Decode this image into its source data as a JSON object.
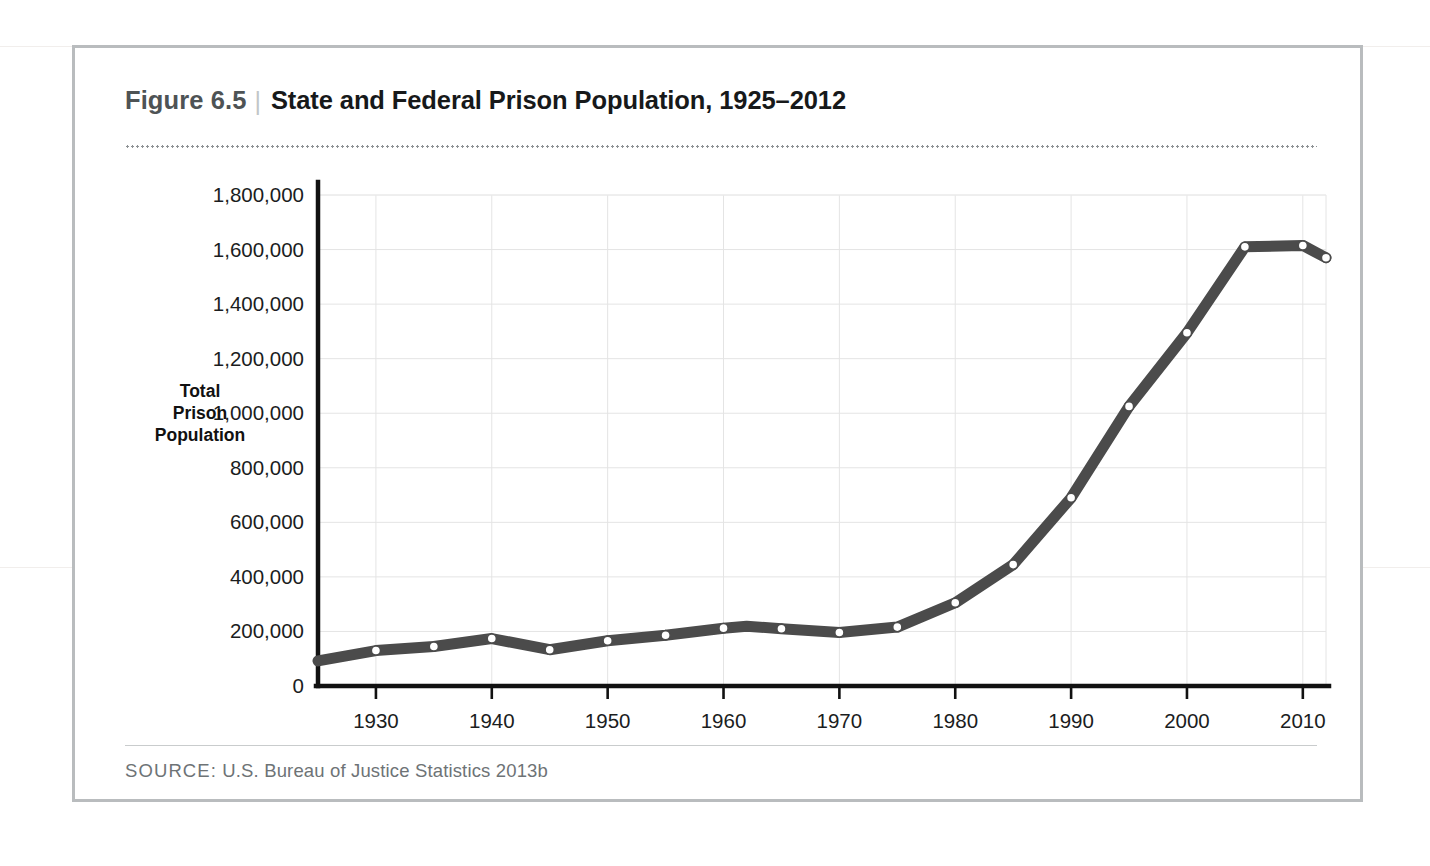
{
  "figure": {
    "number": "Figure 6.5",
    "divider": "|",
    "title": "State and Federal Prison Population, 1925–2012",
    "source_label": "SOURCE:",
    "source_text": " U.S. Bureau of Justice Statistics 2013b"
  },
  "colors": {
    "line": "#4b4b4b",
    "marker_fill": "#ffffff",
    "gridline": "#e4e4e4",
    "axis": "#111111",
    "frame": "#b9bcbe",
    "title": "#17191a",
    "figure_number": "#4e5355",
    "source": "#6e7376"
  },
  "chart_data": {
    "type": "line",
    "title": "State and Federal Prison Population, 1925–2012",
    "xlabel": "",
    "ylabel": "Total Prison Population",
    "ylabel_lines": [
      "Total",
      "Prison",
      "Population"
    ],
    "xlim": [
      1925,
      2012
    ],
    "ylim": [
      0,
      1800000
    ],
    "grid": true,
    "legend": "none",
    "ytick_labels": [
      "0",
      "200,000",
      "400,000",
      "600,000",
      "800,000",
      "1,000,000",
      "1,200,000",
      "1,400,000",
      "1,600,000",
      "1,800,000"
    ],
    "ytick_values": [
      0,
      200000,
      400000,
      600000,
      800000,
      1000000,
      1200000,
      1400000,
      1600000,
      1800000
    ],
    "xtick_labels": [
      "1930",
      "1940",
      "1950",
      "1960",
      "1970",
      "1980",
      "1990",
      "2000",
      "2010"
    ],
    "xtick_values": [
      1930,
      1940,
      1950,
      1960,
      1970,
      1980,
      1990,
      2000,
      2010
    ],
    "series": [
      {
        "name": "Total Prison Population",
        "x": [
          1925,
          1930,
          1935,
          1940,
          1945,
          1950,
          1955,
          1960,
          1962,
          1965,
          1970,
          1975,
          1980,
          1985,
          1990,
          1995,
          2000,
          2005,
          2010,
          2012
        ],
        "values": [
          92000,
          130000,
          145000,
          174000,
          133000,
          166000,
          186000,
          212000,
          219000,
          210000,
          196000,
          216000,
          305000,
          445000,
          690000,
          1025000,
          1295000,
          1610000,
          1615000,
          1570000
        ]
      }
    ]
  }
}
